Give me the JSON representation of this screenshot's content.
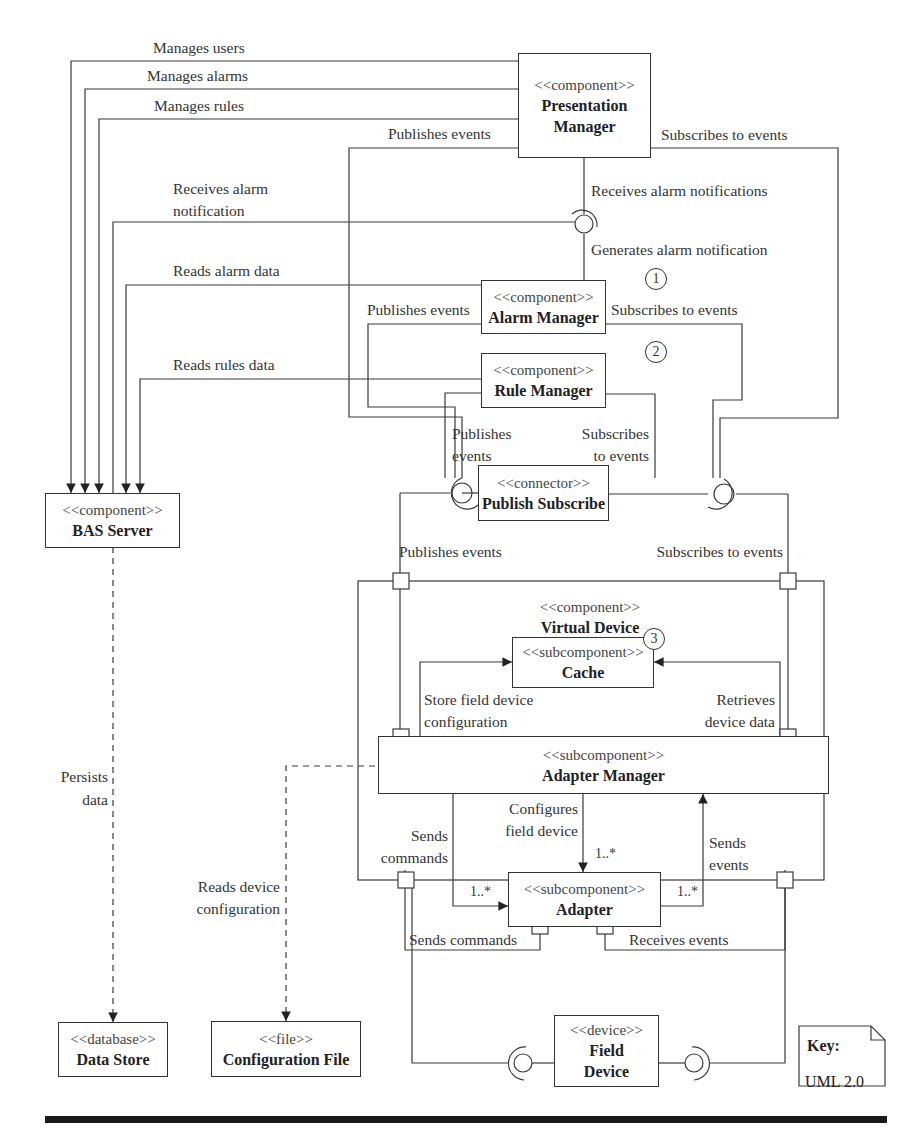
{
  "diagram": {
    "type": "UML component diagram",
    "components": {
      "presentation_manager": {
        "stereotype": "<<component>>",
        "name_line1": "Presentation",
        "name_line2": "Manager"
      },
      "alarm_manager": {
        "stereotype": "<<component>>",
        "name": "Alarm Manager",
        "badge": "1"
      },
      "rule_manager": {
        "stereotype": "<<component>>",
        "name": "Rule Manager",
        "badge": "2"
      },
      "publish_subscribe": {
        "stereotype": "<<connector>>",
        "name": "Publish Subscribe"
      },
      "bas_server": {
        "stereotype": "<<component>>",
        "name": "BAS Server"
      },
      "virtual_device": {
        "stereotype": "<<component>>",
        "name": "Virtual Device"
      },
      "cache": {
        "stereotype": "<<subcomponent>>",
        "name": "Cache",
        "badge": "3"
      },
      "adapter_manager": {
        "stereotype": "<<subcomponent>>",
        "name": "Adapter Manager"
      },
      "adapter": {
        "stereotype": "<<subcomponent>>",
        "name": "Adapter"
      },
      "data_store": {
        "stereotype": "<<database>>",
        "name": "Data Store"
      },
      "configuration_file": {
        "stereotype": "<<file>>",
        "name": "Configuration File"
      },
      "field_device": {
        "stereotype": "<<device>>",
        "name_line1": "Field",
        "name_line2": "Device"
      }
    },
    "labels": {
      "manages_users": "Manages users",
      "manages_alarms": "Manages alarms",
      "manages_rules": "Manages rules",
      "pm_publishes_events": "Publishes events",
      "pm_subscribes_to_events": "Subscribes to events",
      "receives_alarm_notification_1": "Receives alarm",
      "receives_alarm_notification_2": "notification",
      "receives_alarm_notifications": "Receives alarm notifications",
      "generates_alarm_notification": "Generates alarm notification",
      "reads_alarm_data": "Reads alarm data",
      "am_publishes_events": "Publishes events",
      "am_subscribes_to_events": "Subscribes to events",
      "reads_rules_data": "Reads rules data",
      "rm_publishes_1": "Publishes",
      "rm_publishes_2": "events",
      "rm_subscribes_1": "Subscribes",
      "rm_subscribes_2": "to events",
      "vd_publishes_events": "Publishes events",
      "vd_subscribes_to_events": "Subscribes to events",
      "store_config_1": "Store field device",
      "store_config_2": "configuration",
      "retrieves_1": "Retrieves",
      "retrieves_2": "device data",
      "persists_1": "Persists",
      "persists_2": "data",
      "reads_device_config_1": "Reads device",
      "reads_device_config_2": "configuration",
      "sends_commands_1": "Sends",
      "sends_commands_2": "commands",
      "configures_1": "Configures",
      "configures_2": "field device",
      "sends_events_1": "Sends",
      "sends_events_2": "events",
      "adapter_sends_commands": "Sends commands",
      "adapter_receives_events": "Receives events"
    },
    "multiplicities": {
      "left": "1..*",
      "top": "1..*",
      "right": "1..*"
    },
    "key": {
      "title": "Key:",
      "value": "UML  2.0"
    }
  }
}
